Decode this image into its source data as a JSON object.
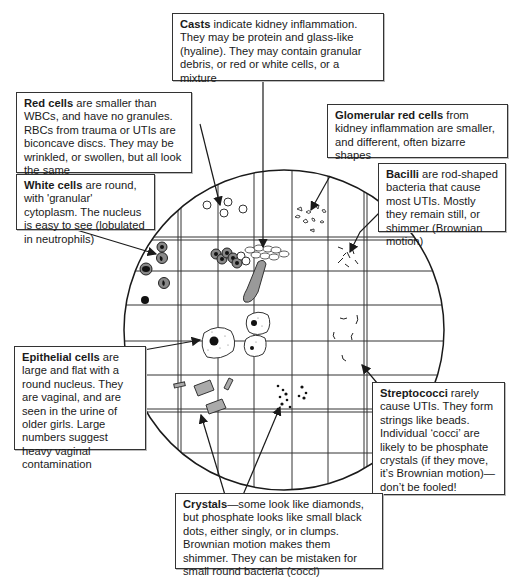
{
  "diagram": {
    "labels": {
      "casts": {
        "term": "Casts",
        "text": " indicate kidney inflammation. They may be protein and glass-like (hyaline). They may contain granular debris, or red or white cells, or a mixture"
      },
      "red_cells": {
        "term": "Red cells",
        "text": " are smaller than WBCs, and have no granules. RBCs from trauma or UTIs are biconcave discs. They may be wrinkled, or swollen, but all look the same"
      },
      "glomerular_red_cells": {
        "term": "Glomerular red cells",
        "text": " from kidney inflammation are smaller, and different, often bizarre shapes"
      },
      "white_cells": {
        "term": "White cells",
        "text": " are round, with 'granular' cytoplasm. The nucleus is easy to see (lobulated in neutrophils)"
      },
      "bacilli": {
        "term": "Bacilli",
        "text": " are rod-shaped bacteria that cause most UTIs. Mostly they remain still, or shimmer (Brownian motion)"
      },
      "epithelial_cells": {
        "term": "Epithelial cells",
        "text": " are large and flat with a round nucleus. They are vaginal, and are seen in the urine of older girls. Large numbers suggest heavy vaginal contamination"
      },
      "streptococci": {
        "term": "Streptococci",
        "text": " rarely cause UTIs. They form strings like beads. Individual ‘cocci’ are likely to be phosphate crystals (if they move, it’s Brownian motion)— don’t be fooled!"
      },
      "crystals": {
        "term": "Crystals",
        "text": "—some look like diamonds, but phosphate looks like small black dots, either singly, or in clumps. Brownian motion makes them shimmer. They can be mistaken for small round bacteria (cocci)"
      }
    },
    "colors": {
      "line": "#1a1a1a",
      "cell_fill": "#8a8a8a",
      "cast_fill": "#9a9a9a",
      "background": "#ffffff"
    }
  }
}
